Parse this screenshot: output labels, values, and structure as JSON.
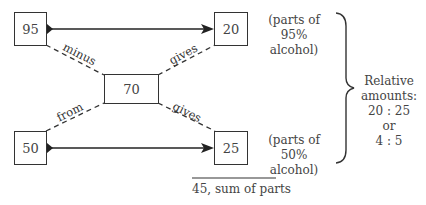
{
  "boxes": {
    "high_strength": "95",
    "high_parts": "20",
    "target": "70",
    "low_strength": "50",
    "low_parts": "25"
  },
  "edge_labels": {
    "minus": "minus",
    "from": "from",
    "gives_top": "gives",
    "gives_bottom": "gives"
  },
  "notes": {
    "top_line1": "(parts of 95%",
    "top_line2": "alcohol)",
    "bottom_line1": "(parts of 50%",
    "bottom_line2": "alcohol)"
  },
  "relative": {
    "line1": "Relative",
    "line2": "amounts:",
    "line3": "20 : 25",
    "line4": "or",
    "line5": "4 : 5"
  },
  "sum_label": "45, sum of parts"
}
